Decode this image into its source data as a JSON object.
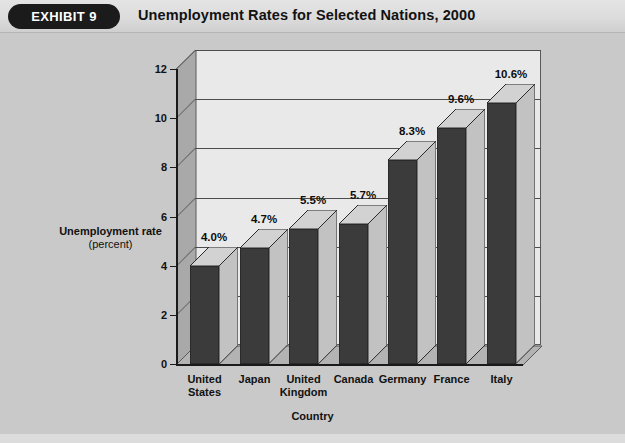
{
  "header": {
    "badge_label": "EXHIBIT 9",
    "title": "Unemployment Rates for Selected Nations, 2000"
  },
  "colors": {
    "page_background": "#c9c9c9",
    "header_background": "#dcdcdc",
    "badge_background": "#1b1b1b",
    "badge_text": "#ffffff",
    "plot_wall": "#e9e9e9",
    "plot_side_wall": "#a9a9a9",
    "floor": "#b3b3b3",
    "gridline": "#4d4d4d",
    "axis": "#1a1a1a",
    "bar_front": "#3b3b3b",
    "bar_top": "#d2d2d2",
    "bar_side": "#c2c2c2",
    "text": "#111111"
  },
  "chart_data": {
    "type": "bar",
    "title": "Unemployment Rates for Selected Nations, 2000",
    "xlabel": "Country",
    "ylabel": "Unemployment rate",
    "ylabel_unit": "(percent)",
    "ylim": [
      0,
      12
    ],
    "yticks": [
      0,
      2,
      4,
      6,
      8,
      10,
      12
    ],
    "ytick_labels": [
      "0",
      "2",
      "4",
      "6",
      "8",
      "10",
      "12"
    ],
    "grid": true,
    "legend": false,
    "three_d": true,
    "categories": [
      "United States",
      "Japan",
      "United Kingdom",
      "Canada",
      "Germany",
      "France",
      "Italy"
    ],
    "category_lines": [
      [
        "United",
        "States"
      ],
      [
        "Japan"
      ],
      [
        "United",
        "Kingdom"
      ],
      [
        "Canada"
      ],
      [
        "Germany"
      ],
      [
        "France"
      ],
      [
        "Italy"
      ]
    ],
    "values": [
      4.0,
      4.7,
      5.5,
      5.7,
      8.3,
      9.6,
      10.6
    ],
    "value_labels": [
      "4.0%",
      "4.7%",
      "5.5%",
      "5.7%",
      "8.3%",
      "9.6%",
      "10.6%"
    ]
  },
  "footer": {
    "sliver_text": ""
  }
}
